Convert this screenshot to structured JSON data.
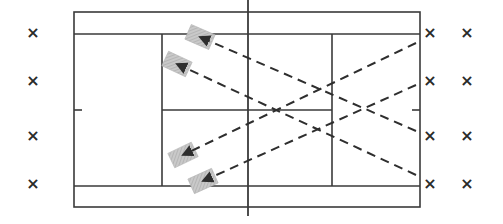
{
  "diagram": {
    "type": "tennis-court-drill",
    "colors": {
      "line": "#3a3a3a",
      "dash": "#2e2e2e",
      "ball_box": "#bdbdbd",
      "marker": "#2a2a2a"
    },
    "court": {
      "outer": {
        "x1": 74,
        "y1": 12,
        "x2": 420,
        "y2": 207
      },
      "singles_top_y": 34,
      "singles_bottom_y": 186,
      "net_x": 248,
      "net_y1": 0,
      "net_y2": 216,
      "service_left_x": 162,
      "service_right_x": 332,
      "center_service_y": 110
    },
    "markers": {
      "symbol": "×",
      "positions": [
        {
          "x": 33,
          "y": 33
        },
        {
          "x": 33,
          "y": 81
        },
        {
          "x": 33,
          "y": 136
        },
        {
          "x": 33,
          "y": 184
        },
        {
          "x": 430,
          "y": 33
        },
        {
          "x": 430,
          "y": 81
        },
        {
          "x": 430,
          "y": 136
        },
        {
          "x": 430,
          "y": 184
        },
        {
          "x": 467,
          "y": 33
        },
        {
          "x": 467,
          "y": 81
        },
        {
          "x": 467,
          "y": 136
        },
        {
          "x": 467,
          "y": 184
        }
      ]
    },
    "shots": [
      {
        "from": {
          "x": 416,
          "y": 43
        },
        "to": {
          "x": 183,
          "y": 155
        }
      },
      {
        "from": {
          "x": 416,
          "y": 85
        },
        "to": {
          "x": 203,
          "y": 181
        }
      },
      {
        "from": {
          "x": 416,
          "y": 131
        },
        "to": {
          "x": 200,
          "y": 37
        }
      },
      {
        "from": {
          "x": 416,
          "y": 175
        },
        "to": {
          "x": 177,
          "y": 64
        }
      }
    ]
  }
}
